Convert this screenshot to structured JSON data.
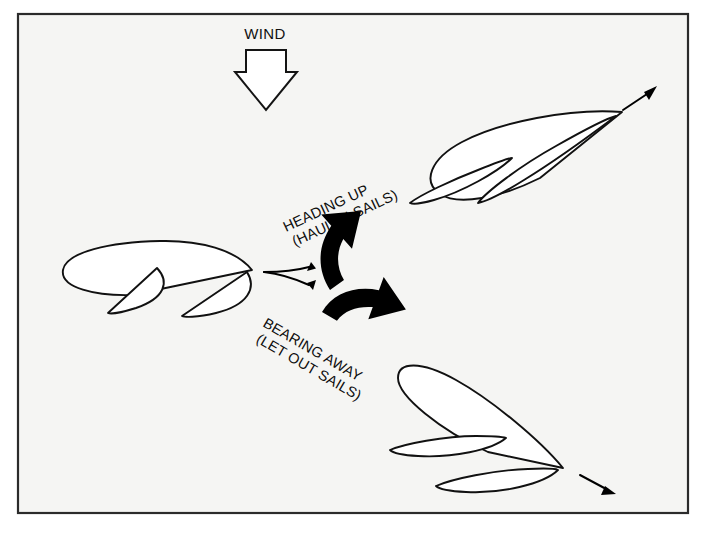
{
  "figure": {
    "title_text": "WIND",
    "background_color": "#f5f5f3",
    "frame_color": "#2b2b2b",
    "line_color": "#111111",
    "arrow_fill": "#000000"
  },
  "wind": {
    "label": "WIND",
    "direction": "downward",
    "icon": "wind-arrow-down-icon"
  },
  "maneuvers": [
    {
      "id": "heading-up",
      "line1": "HEADING UP",
      "line2": "(HAUL IN SAILS)",
      "rotation_deg": -25,
      "arrow_icon": "curved-arrow-up-right-icon"
    },
    {
      "id": "bearing-away",
      "line1": "BEARING AWAY",
      "line2": "(LET OUT SAILS)",
      "rotation_deg": 30,
      "arrow_icon": "curved-arrow-down-right-icon"
    }
  ],
  "boats": [
    {
      "id": "start-boat",
      "label": "sailboat-start",
      "position": "center-left",
      "heading": "beam-reach",
      "sail_trim": "medium"
    },
    {
      "id": "heading-up-boat",
      "label": "sailboat-close-hauled",
      "position": "upper-right",
      "heading": "up-right",
      "sail_trim": "hauled-in"
    },
    {
      "id": "bearing-away-boat",
      "label": "sailboat-broad-reach",
      "position": "lower-right",
      "heading": "down-right",
      "sail_trim": "let-out"
    }
  ],
  "course_arrows": [
    {
      "id": "course-arrow-up",
      "direction": "up-right"
    },
    {
      "id": "course-arrow-down",
      "direction": "down-right"
    },
    {
      "id": "course-arrow-top-boat",
      "direction": "up-right"
    },
    {
      "id": "course-arrow-bottom-boat",
      "direction": "down-right"
    }
  ]
}
